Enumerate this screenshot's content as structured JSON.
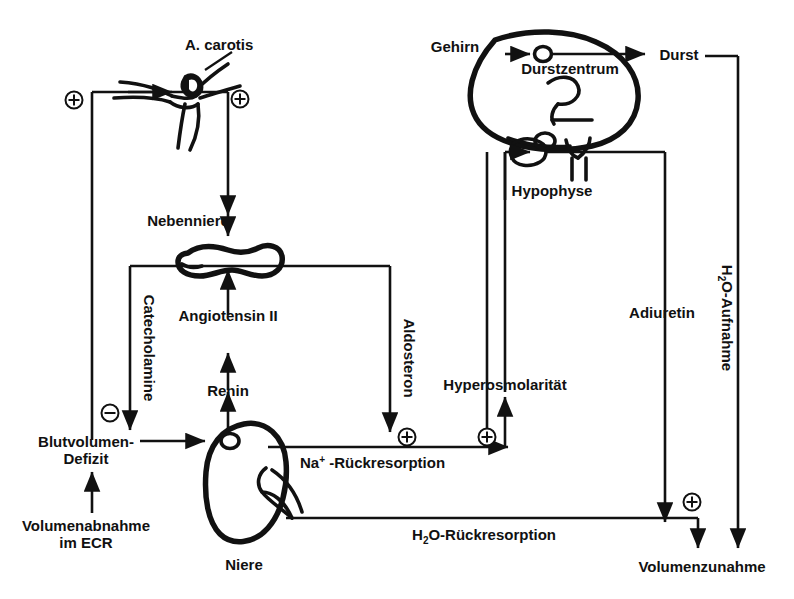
{
  "diagram": {
    "title_text": "",
    "language": "de",
    "line_color": "#111111",
    "background": "#ffffff",
    "nodes": {
      "a_carotis": "A. carotis",
      "nebenniere": "Nebenniere",
      "angiotensin": "Angiotensin II",
      "renin": "Renin",
      "catecholamine": "Catecholamine",
      "aldosteron": "Aldosteron",
      "blutvolumen_line1": "Blutvolumen-",
      "blutvolumen_line2": "Defizit",
      "volumenabnahme_line1": "Volumenabnahme",
      "volumenabnahme_line2": "im ECR",
      "niere": "Niere",
      "na_rueckresorption_prefix": "Na",
      "na_rueckresorption_sup": "+",
      "na_rueckresorption_suffix": " -Rückresorption",
      "hyperosmolaritaet": "Hyperosmolarität",
      "gehirn": "Gehirn",
      "durstzentrum": "Durstzentrum",
      "durst": "Durst",
      "hypophyse": "Hypophyse",
      "adiuretin": "Adiuretin",
      "h2o_aufnahme_prefix": "H",
      "h2o_aufnahme_sub": "2",
      "h2o_aufnahme_suffix": "O-Aufnahme",
      "h2o_rueck_prefix": "H",
      "h2o_rueck_sub": "2",
      "h2o_rueck_suffix": "O-Rückresorption",
      "volumenzunahme": "Volumenzunahme"
    },
    "signs": {
      "plus": "+",
      "minus": "−",
      "plus_carotis_left": "+",
      "plus_carotis_right": "+",
      "minus_blutvolumen": "−",
      "plus_na": "+",
      "plus_na_right": "+",
      "plus_volumenzunahme": "+"
    }
  }
}
